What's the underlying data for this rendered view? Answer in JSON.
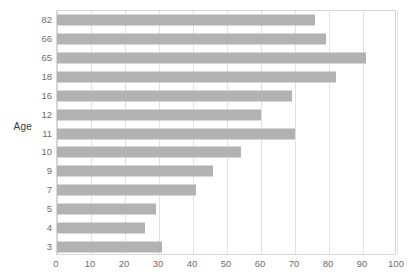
{
  "chart_data": {
    "type": "bar",
    "orientation": "horizontal",
    "title": "",
    "xlabel": "",
    "ylabel": "Age",
    "xlim": [
      0,
      100
    ],
    "ylim": null,
    "grid": true,
    "legend": null,
    "bar_color": "#b2b2b2",
    "gridline_color": "#e2e2e2",
    "axis_color": "#d6d6d6",
    "tick_label_color": "#6d6d6d",
    "xticks": [
      0,
      10,
      20,
      30,
      40,
      50,
      60,
      70,
      80,
      90,
      100
    ],
    "xtick_labels": [
      "0",
      "10",
      "20",
      "30",
      "40",
      "50",
      "60",
      "70",
      "80",
      "90",
      "100"
    ],
    "categories": [
      "82",
      "66",
      "65",
      "18",
      "16",
      "12",
      "11",
      "10",
      "9",
      "7",
      "5",
      "4",
      "3"
    ],
    "values": [
      76,
      79,
      91,
      82,
      69,
      60,
      70,
      54,
      46,
      41,
      29,
      26,
      31
    ],
    "bars": [
      {
        "category": "82",
        "value": 76
      },
      {
        "category": "66",
        "value": 79
      },
      {
        "category": "65",
        "value": 91
      },
      {
        "category": "18",
        "value": 82
      },
      {
        "category": "16",
        "value": 69
      },
      {
        "category": "12",
        "value": 60
      },
      {
        "category": "11",
        "value": 70
      },
      {
        "category": "10",
        "value": 54
      },
      {
        "category": "9",
        "value": 46
      },
      {
        "category": "7",
        "value": 41
      },
      {
        "category": "5",
        "value": 29
      },
      {
        "category": "4",
        "value": 26
      },
      {
        "category": "3",
        "value": 31
      }
    ]
  }
}
